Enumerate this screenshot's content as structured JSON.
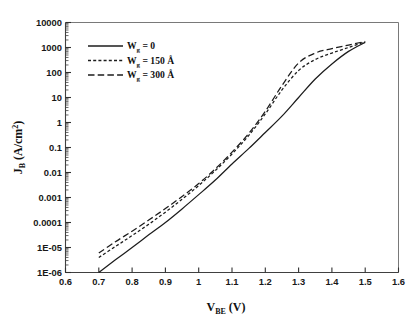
{
  "chart_data": {
    "type": "line",
    "title": "",
    "subtitle": "",
    "xlabel": "V_BE (V)",
    "xlabel_main": "V",
    "xlabel_sub": "BE",
    "xlabel_unit": " (V)",
    "ylabel": "J_B (A/cm^2)",
    "ylabel_main": "J",
    "ylabel_sub": "B",
    "ylabel_unit": " (A/cm",
    "ylabel_sup": "2",
    "ylabel_close": ")",
    "xscale": "linear",
    "yscale": "log",
    "xlim": [
      0.6,
      1.6
    ],
    "ylim": [
      1e-06,
      10000
    ],
    "grid": false,
    "legend_position": "upper-left",
    "x_ticks": [
      0.6,
      0.7,
      0.8,
      0.9,
      1.0,
      1.1,
      1.2,
      1.3,
      1.4,
      1.5,
      1.6
    ],
    "x_tick_labels": [
      "0.6",
      "0.7",
      "0.8",
      "0.9",
      "1",
      "1.1",
      "1.2",
      "1.3",
      "1.4",
      "1.5",
      "1.6"
    ],
    "y_ticks": [
      1e-06,
      1e-05,
      0.0001,
      0.001,
      0.01,
      0.1,
      1,
      10,
      100,
      1000,
      10000
    ],
    "y_tick_labels": [
      "1E-06",
      "1E-05",
      "0.0001",
      "0.001",
      "0.01",
      "0.1",
      "1",
      "10",
      "100",
      "1000",
      "10000"
    ],
    "series": [
      {
        "name": "W_g = 0",
        "label_main": "W",
        "label_sub": "g",
        "label_rest": " = 0",
        "style": "solid",
        "color": "#1c1c1c",
        "x": [
          0.7,
          0.75,
          0.8,
          0.85,
          0.9,
          0.95,
          1.0,
          1.05,
          1.1,
          1.15,
          1.2,
          1.25,
          1.3,
          1.35,
          1.4,
          1.45,
          1.5
        ],
        "y": [
          1e-06,
          3.2e-06,
          1e-05,
          3.2e-05,
          0.0001,
          0.00035,
          0.0013,
          0.005,
          0.022,
          0.09,
          0.4,
          1.8,
          10.0,
          55.0,
          220.0,
          700.0,
          1600.0
        ]
      },
      {
        "name": "W_g = 150 A",
        "label_main": "W",
        "label_sub": "g",
        "label_rest": " = 150 Å",
        "style": "dotted",
        "color": "#1c1c1c",
        "x": [
          0.7,
          0.75,
          0.8,
          0.85,
          0.9,
          0.95,
          1.0,
          1.05,
          1.1,
          1.15,
          1.2,
          1.25,
          1.3,
          1.35,
          1.4,
          1.45,
          1.5
        ],
        "y": [
          4e-06,
          1.1e-05,
          3e-05,
          8.5e-05,
          0.00026,
          0.00085,
          0.003,
          0.012,
          0.055,
          0.3,
          2.2,
          20.0,
          120.0,
          330.0,
          600.0,
          1000.0,
          1700.0
        ]
      },
      {
        "name": "W_g = 300 A",
        "label_main": "W",
        "label_sub": "g",
        "label_rest": " = 300 Å",
        "style": "dashed",
        "color": "#1c1c1c",
        "x": [
          0.7,
          0.75,
          0.8,
          0.85,
          0.9,
          0.95,
          1.0,
          1.05,
          1.1,
          1.15,
          1.2,
          1.25,
          1.3,
          1.35,
          1.4,
          1.45,
          1.5
        ],
        "y": [
          6e-06,
          1.7e-05,
          4.5e-05,
          0.000125,
          0.00036,
          0.0011,
          0.0036,
          0.014,
          0.065,
          0.36,
          2.8,
          30.0,
          240.0,
          600.0,
          900.0,
          1250.0,
          1750.0
        ]
      }
    ]
  },
  "legend": {
    "entries": [
      {
        "style": "solid",
        "text": "W_g = 0"
      },
      {
        "style": "dotted",
        "text": "W_g = 150 Å"
      },
      {
        "style": "dashed",
        "text": "W_g = 300 Å"
      }
    ]
  }
}
